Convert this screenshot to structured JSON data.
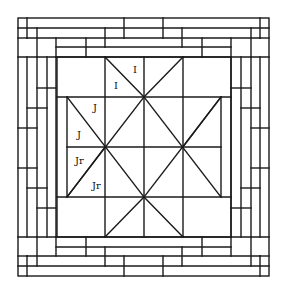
{
  "diagram": {
    "type": "quilt-block-pattern",
    "stroke_color": "#1a1a1a",
    "background": "#ffffff",
    "center_block": {
      "description": "Pinwheel / diamond-in-square center with diagonal triangle patches",
      "grid_x": [
        57,
        105,
        144,
        183,
        231
      ],
      "grid_y": [
        57,
        97,
        147,
        197,
        237
      ]
    },
    "border": {
      "description": "Log-cabin style nested strip borders, four rows per side"
    },
    "labels": [
      {
        "text": "I",
        "x": 133,
        "y": 73
      },
      {
        "text": "I",
        "x": 114,
        "y": 89
      },
      {
        "text": "J",
        "x": 93,
        "y": 111
      },
      {
        "text": "J",
        "x": 77,
        "y": 138
      },
      {
        "text": "Jr",
        "x": 75,
        "y": 164
      },
      {
        "text": "Jr",
        "x": 92,
        "y": 189
      }
    ]
  }
}
